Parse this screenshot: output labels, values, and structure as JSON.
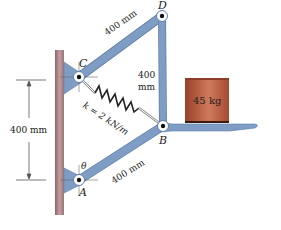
{
  "diagram": {
    "points": {
      "A": {
        "label": "A",
        "x": 79,
        "y": 180
      },
      "B": {
        "label": "B",
        "x": 163,
        "y": 126
      },
      "C": {
        "label": "C",
        "x": 79,
        "y": 77
      },
      "D": {
        "label": "D",
        "x": 162,
        "y": 16
      }
    },
    "labels": {
      "link_cd": "400 mm",
      "link_db_top": "400",
      "link_db_bottom": "mm",
      "link_ab": "400 mm",
      "spring": "k = 2 kN/m",
      "mass": "45 kg",
      "dimension": "400 mm",
      "angle": "θ"
    },
    "colors": {
      "link": "#7f9dc4",
      "link_edge": "#5e7ea8",
      "wall": "#a47a7e",
      "mass": "#b5553c",
      "mass_dark": "#8e3d28"
    }
  }
}
